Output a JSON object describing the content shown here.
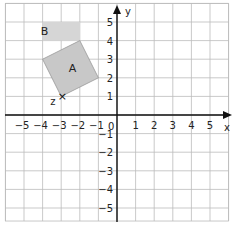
{
  "diagram": {
    "x_axis_label": "x",
    "y_axis_label": "y",
    "x_ticks": [
      "−5",
      "−4",
      "−3",
      "−2",
      "−1",
      "1",
      "2",
      "3",
      "4",
      "5"
    ],
    "y_ticks": [
      "5",
      "4",
      "3",
      "2",
      "1",
      "−1",
      "−2",
      "−3",
      "−4",
      "−5"
    ],
    "origin_label": "0",
    "shapes": [
      {
        "label": "A",
        "type": "square",
        "vertices": [
          [
            -3,
            1
          ],
          [
            -1,
            2
          ],
          [
            -2,
            4
          ],
          [
            -4,
            3
          ]
        ],
        "fill": "#c8c8c8"
      },
      {
        "label": "B",
        "type": "rectangle",
        "vertices": [
          [
            -4,
            4
          ],
          [
            -2,
            4
          ],
          [
            -2,
            5
          ],
          [
            -4,
            5
          ]
        ],
        "fill": "#d6d6d6"
      }
    ],
    "points": [
      {
        "label": "z",
        "x": -3,
        "y": 1,
        "marker": "×"
      }
    ]
  }
}
